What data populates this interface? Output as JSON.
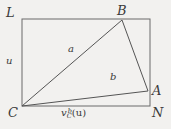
{
  "figure": {
    "background_color": "#f2f1ef",
    "stroke_color": "#555555",
    "label_color": "#3a3a3a",
    "rectangle": {
      "x1": 22,
      "y1": 19,
      "x2": 150,
      "y2": 106
    },
    "points": {
      "L": {
        "x": 22,
        "y": 19,
        "label": "L"
      },
      "B": {
        "x": 122,
        "y": 20,
        "label": "B"
      },
      "A": {
        "x": 148,
        "y": 91,
        "label": "A"
      },
      "N": {
        "x": 150,
        "y": 106,
        "label": "N"
      },
      "C": {
        "x": 22,
        "y": 106,
        "label": "C"
      }
    },
    "segments": [
      {
        "name": "C-B",
        "from": "C",
        "to": "B",
        "label": "a"
      },
      {
        "name": "C-A",
        "from": "C",
        "to": "A",
        "label": "b"
      },
      {
        "name": "B-A",
        "from": "B",
        "to": "A",
        "label": ""
      }
    ],
    "labels": {
      "L": "L",
      "B": "B",
      "A": "A",
      "N": "N",
      "C": "C",
      "segment_a": "a",
      "segment_b": "b",
      "height_u": "u",
      "base_v": "v",
      "base_v_sub": "C",
      "base_v_sup": "b",
      "base_v_arg": "(u)"
    }
  }
}
